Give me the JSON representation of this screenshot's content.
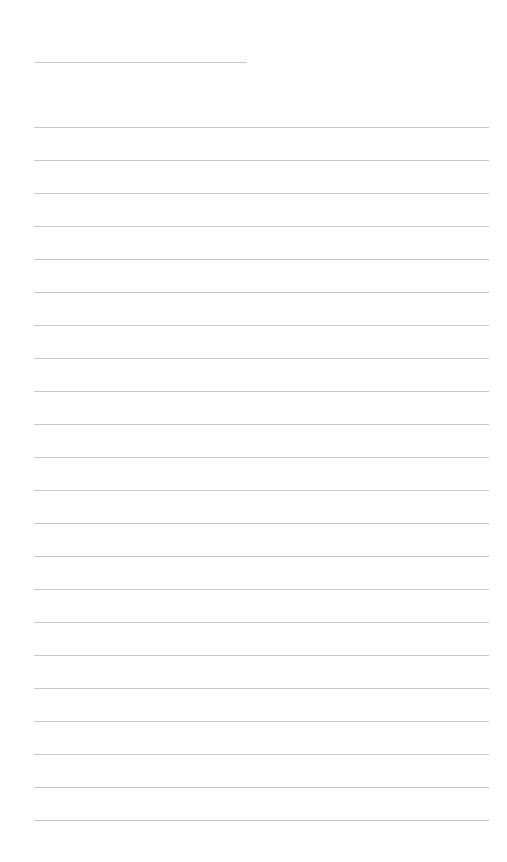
{
  "page": {
    "type": "blank lined paper",
    "background": "#ffffff",
    "rule_color": "#c9c9c9",
    "title_line": {
      "text": ""
    },
    "lines": [
      {
        "text": ""
      },
      {
        "text": ""
      },
      {
        "text": ""
      },
      {
        "text": ""
      },
      {
        "text": ""
      },
      {
        "text": ""
      },
      {
        "text": ""
      },
      {
        "text": ""
      },
      {
        "text": ""
      },
      {
        "text": ""
      },
      {
        "text": ""
      },
      {
        "text": ""
      },
      {
        "text": ""
      },
      {
        "text": ""
      },
      {
        "text": ""
      },
      {
        "text": ""
      },
      {
        "text": ""
      },
      {
        "text": ""
      },
      {
        "text": ""
      },
      {
        "text": ""
      },
      {
        "text": ""
      },
      {
        "text": ""
      }
    ]
  }
}
